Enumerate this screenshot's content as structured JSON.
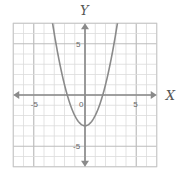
{
  "chart_data": {
    "type": "line",
    "title": "",
    "xlabel": "X",
    "ylabel": "Y",
    "xlim": [
      -7,
      7
    ],
    "ylim": [
      -7,
      7
    ],
    "grid": true,
    "grid_minor_step": 1,
    "grid_major_step": 5,
    "x_ticks": [
      {
        "value": -5,
        "label": "-5"
      },
      {
        "value": 0,
        "label": "0"
      },
      {
        "value": 5,
        "label": "5"
      }
    ],
    "y_ticks": [
      {
        "value": 5,
        "label": "5"
      },
      {
        "value": -5,
        "label": "-5"
      }
    ],
    "series": [
      {
        "name": "y = x^2 - 3",
        "equation": "y = x^2 - 3",
        "vertex": [
          0,
          -3
        ],
        "x_intercepts": [
          -1.73,
          1.73
        ],
        "x": [
          -3.2,
          -3,
          -2.5,
          -2,
          -1.5,
          -1,
          -0.5,
          0,
          0.5,
          1,
          1.5,
          2,
          2.5,
          3,
          3.2
        ],
        "y": [
          7.24,
          6,
          3.25,
          1,
          -0.75,
          -2,
          -2.75,
          -3,
          -2.75,
          -2,
          -0.75,
          1,
          3.25,
          6,
          7.24
        ],
        "color": "#8a8a8a"
      }
    ],
    "axis_color": "#8a8a8a",
    "grid_color": "#dcdcdc",
    "grid_major_color": "#bdbdbd",
    "legend": "none"
  }
}
